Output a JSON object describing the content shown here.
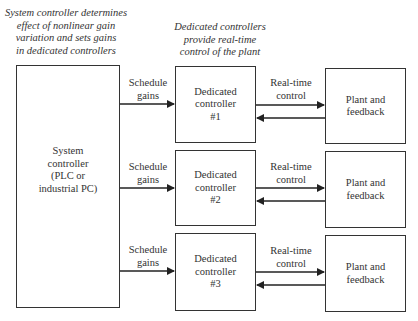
{
  "annotations": {
    "system_note": "System controller determines\neffect of nonlinear gain\nvariation and sets gains\nin dedicated controllers",
    "dedicated_note": "Dedicated controllers\nprovide real-time\ncontrol of the plant"
  },
  "system_controller": {
    "label": "System\ncontroller\n(PLC or\nindustrial PC)"
  },
  "channels": [
    {
      "schedule_label": "Schedule\ngains",
      "controller_label": "Dedicated\ncontroller\n#1",
      "control_label": "Real-time\ncontrol",
      "plant_label": "Plant and\nfeedback"
    },
    {
      "schedule_label": "Schedule\ngains",
      "controller_label": "Dedicated\ncontroller\n#2",
      "control_label": "Real-time\ncontrol",
      "plant_label": "Plant and\nfeedback"
    },
    {
      "schedule_label": "Schedule\ngains",
      "controller_label": "Dedicated\ncontroller\n#3",
      "control_label": "Real-time\ncontrol",
      "plant_label": "Plant and\nfeedback"
    }
  ]
}
